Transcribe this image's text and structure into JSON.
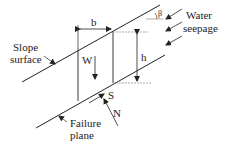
{
  "diagram": {
    "labels": {
      "beta": "β",
      "water": "Water",
      "seepage": "seepage",
      "b": "b",
      "h": "h",
      "slope1": "Slope",
      "slope2": "surface",
      "w": "W",
      "s": "S",
      "n": "N",
      "failure1": "Failure",
      "failure2": "plane"
    },
    "colors": {
      "line": "#222222",
      "dashed": "#888888",
      "background": "#ffffff"
    }
  }
}
